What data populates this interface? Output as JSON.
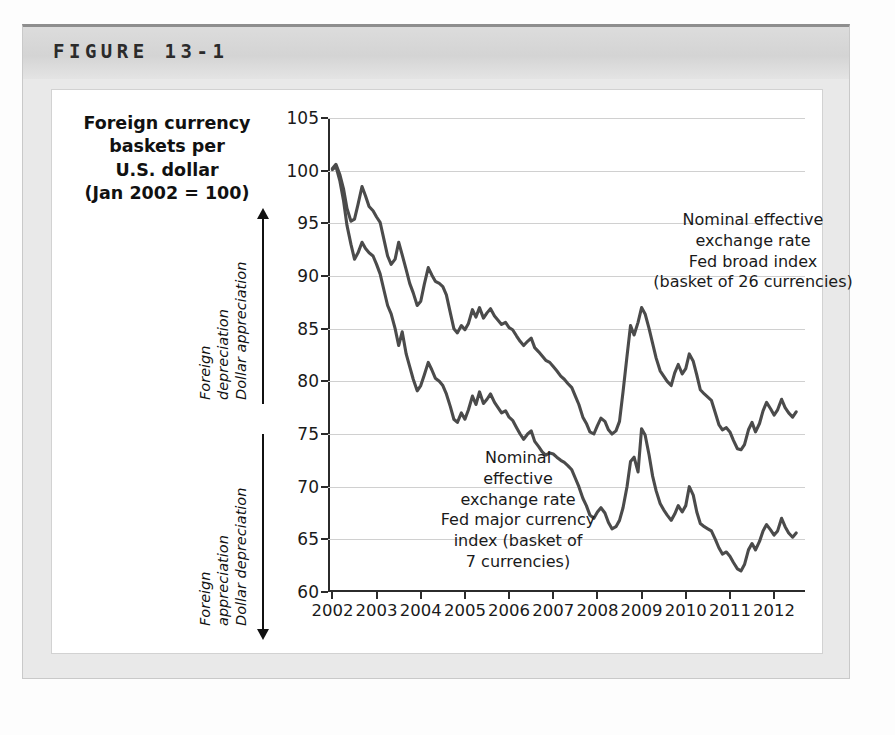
{
  "figure": {
    "label": "FIGURE 13-1"
  },
  "axis_title": {
    "line1": "Foreign currency",
    "line2": "baskets per",
    "line3": "U.S. dollar",
    "line4": "(Jan 2002 = 100)"
  },
  "direction_annotations": {
    "upper": {
      "line1": "Foreign",
      "line2": "depreciation",
      "line3": "Dollar appreciation",
      "arrow": "arrow-up"
    },
    "lower": {
      "line1": "Foreign",
      "line2": "appreciation",
      "line3": "Dollar depreciation",
      "arrow": "arrow-down"
    }
  },
  "series_annotations": {
    "broad": {
      "line1": "Nominal effective",
      "line2": "exchange rate",
      "line3": "Fed broad index",
      "line4": "(basket of 26 currencies)"
    },
    "major": {
      "line1": "Nominal",
      "line2": "effective",
      "line3": "exchange rate",
      "line4": "Fed major currency",
      "line5": "index (basket of",
      "line6": "7 currencies)"
    }
  },
  "colors": {
    "line": "#4b4b4b",
    "grid": "#d0d0d0",
    "axis": "#2b2b2b",
    "card_background": "#e9e9e9",
    "header_band": "#d7d7d7",
    "panel": "#ffffff"
  },
  "chart_data": {
    "type": "line",
    "title": "Foreign currency baskets per U.S. dollar (Jan 2002 = 100)",
    "xlabel": "",
    "ylabel": "Foreign currency baskets per U.S. dollar (Jan 2002 = 100)",
    "xlim": [
      2001.9,
      2012.7
    ],
    "ylim": [
      60,
      105
    ],
    "ytick_labels": [
      "60",
      "65",
      "70",
      "75",
      "80",
      "85",
      "90",
      "95",
      "100",
      "105"
    ],
    "yticks": [
      60,
      65,
      70,
      75,
      80,
      85,
      90,
      95,
      100,
      105
    ],
    "xtick_labels": [
      "2002",
      "2003",
      "2004",
      "2005",
      "2006",
      "2007",
      "2008",
      "2009",
      "2010",
      "2011",
      "2012"
    ],
    "xticks": [
      2002,
      2003,
      2004,
      2005,
      2006,
      2007,
      2008,
      2009,
      2010,
      2011,
      2012
    ],
    "grid": true,
    "legend": "in-plot annotations",
    "series": [
      {
        "name": "Nominal effective exchange rate Fed broad index (basket of 26 currencies)",
        "x": [
          2002.0,
          2002.08,
          2002.17,
          2002.25,
          2002.33,
          2002.42,
          2002.5,
          2002.58,
          2002.67,
          2002.75,
          2002.83,
          2002.92,
          2003.0,
          2003.08,
          2003.17,
          2003.25,
          2003.33,
          2003.42,
          2003.5,
          2003.58,
          2003.67,
          2003.75,
          2003.83,
          2003.92,
          2004.0,
          2004.08,
          2004.17,
          2004.25,
          2004.33,
          2004.42,
          2004.5,
          2004.58,
          2004.67,
          2004.75,
          2004.83,
          2004.92,
          2005.0,
          2005.08,
          2005.17,
          2005.25,
          2005.33,
          2005.42,
          2005.5,
          2005.58,
          2005.67,
          2005.75,
          2005.83,
          2005.92,
          2006.0,
          2006.08,
          2006.17,
          2006.25,
          2006.33,
          2006.42,
          2006.5,
          2006.58,
          2006.67,
          2006.75,
          2006.83,
          2006.92,
          2007.0,
          2007.08,
          2007.17,
          2007.25,
          2007.33,
          2007.42,
          2007.5,
          2007.58,
          2007.67,
          2007.75,
          2007.83,
          2007.92,
          2008.0,
          2008.08,
          2008.17,
          2008.25,
          2008.33,
          2008.42,
          2008.5,
          2008.58,
          2008.67,
          2008.75,
          2008.83,
          2008.92,
          2009.0,
          2009.08,
          2009.17,
          2009.25,
          2009.33,
          2009.42,
          2009.5,
          2009.58,
          2009.67,
          2009.75,
          2009.83,
          2009.92,
          2010.0,
          2010.08,
          2010.17,
          2010.25,
          2010.33,
          2010.42,
          2010.5,
          2010.58,
          2010.67,
          2010.75,
          2010.83,
          2010.92,
          2011.0,
          2011.08,
          2011.17,
          2011.25,
          2011.33,
          2011.42,
          2011.5,
          2011.58,
          2011.67,
          2011.75,
          2011.83,
          2011.92,
          2012.0,
          2012.08,
          2012.17,
          2012.25,
          2012.33,
          2012.42,
          2012.5
        ],
        "y": [
          100.2,
          100.6,
          99.6,
          98.3,
          96.4,
          95.2,
          95.4,
          96.8,
          98.5,
          97.6,
          96.6,
          96.2,
          95.6,
          95.1,
          93.4,
          91.9,
          91.1,
          91.6,
          93.2,
          92.0,
          90.6,
          89.3,
          88.4,
          87.2,
          87.6,
          89.2,
          90.8,
          90.1,
          89.5,
          89.3,
          89.0,
          88.2,
          86.5,
          85.0,
          84.6,
          85.3,
          84.9,
          85.5,
          86.8,
          86.1,
          87.0,
          86.0,
          86.5,
          86.9,
          86.2,
          85.8,
          85.4,
          85.6,
          85.1,
          84.9,
          84.3,
          83.8,
          83.4,
          83.8,
          84.1,
          83.2,
          82.8,
          82.4,
          82.0,
          81.8,
          81.4,
          81.0,
          80.5,
          80.2,
          79.8,
          79.4,
          78.6,
          77.8,
          76.6,
          76.0,
          75.2,
          75.0,
          75.8,
          76.5,
          76.2,
          75.4,
          75.0,
          75.3,
          76.2,
          79.0,
          82.4,
          85.3,
          84.4,
          85.6,
          87.0,
          86.4,
          85.0,
          83.6,
          82.2,
          81.0,
          80.5,
          80.0,
          79.6,
          80.8,
          81.6,
          80.7,
          81.2,
          82.6,
          81.9,
          80.6,
          79.2,
          78.8,
          78.5,
          78.2,
          77.0,
          75.9,
          75.4,
          75.6,
          75.2,
          74.4,
          73.6,
          73.5,
          74.0,
          75.4,
          76.1,
          75.2,
          76.0,
          77.2,
          78.0,
          77.4,
          76.8,
          77.3,
          78.3,
          77.5,
          77.0,
          76.6,
          77.1
        ]
      },
      {
        "name": "Nominal effective exchange rate Fed major currency index (basket of 7 currencies)",
        "x": [
          2002.0,
          2002.08,
          2002.17,
          2002.25,
          2002.33,
          2002.42,
          2002.5,
          2002.58,
          2002.67,
          2002.75,
          2002.83,
          2002.92,
          2003.0,
          2003.08,
          2003.17,
          2003.25,
          2003.33,
          2003.42,
          2003.5,
          2003.58,
          2003.67,
          2003.75,
          2003.83,
          2003.92,
          2004.0,
          2004.08,
          2004.17,
          2004.25,
          2004.33,
          2004.42,
          2004.5,
          2004.58,
          2004.67,
          2004.75,
          2004.83,
          2004.92,
          2005.0,
          2005.08,
          2005.17,
          2005.25,
          2005.33,
          2005.42,
          2005.5,
          2005.58,
          2005.67,
          2005.75,
          2005.83,
          2005.92,
          2006.0,
          2006.08,
          2006.17,
          2006.25,
          2006.33,
          2006.42,
          2006.5,
          2006.58,
          2006.67,
          2006.75,
          2006.83,
          2006.92,
          2007.0,
          2007.08,
          2007.17,
          2007.25,
          2007.33,
          2007.42,
          2007.5,
          2007.58,
          2007.67,
          2007.75,
          2007.83,
          2007.92,
          2008.0,
          2008.08,
          2008.17,
          2008.25,
          2008.33,
          2008.42,
          2008.5,
          2008.58,
          2008.67,
          2008.75,
          2008.83,
          2008.92,
          2009.0,
          2009.08,
          2009.17,
          2009.25,
          2009.33,
          2009.42,
          2009.5,
          2009.58,
          2009.67,
          2009.75,
          2009.83,
          2009.92,
          2010.0,
          2010.08,
          2010.17,
          2010.25,
          2010.33,
          2010.42,
          2010.5,
          2010.58,
          2010.67,
          2010.75,
          2010.83,
          2010.92,
          2011.0,
          2011.08,
          2011.17,
          2011.25,
          2011.33,
          2011.42,
          2011.5,
          2011.58,
          2011.67,
          2011.75,
          2011.83,
          2011.92,
          2012.0,
          2012.08,
          2012.17,
          2012.25,
          2012.33,
          2012.42,
          2012.5
        ],
        "y": [
          100.1,
          100.4,
          99.0,
          97.2,
          94.8,
          93.0,
          91.6,
          92.2,
          93.2,
          92.6,
          92.2,
          91.9,
          91.1,
          90.2,
          88.6,
          87.2,
          86.4,
          85.0,
          83.4,
          84.7,
          82.6,
          81.4,
          80.2,
          79.1,
          79.6,
          80.6,
          81.8,
          81.1,
          80.3,
          80.0,
          79.6,
          78.8,
          77.6,
          76.4,
          76.1,
          77.0,
          76.4,
          77.3,
          78.6,
          77.8,
          79.0,
          77.9,
          78.3,
          78.8,
          78.0,
          77.5,
          77.0,
          77.2,
          76.6,
          76.3,
          75.6,
          75.0,
          74.5,
          75.0,
          75.3,
          74.3,
          73.8,
          73.3,
          73.0,
          73.2,
          73.1,
          72.8,
          72.5,
          72.3,
          72.0,
          71.6,
          70.8,
          70.0,
          68.9,
          68.2,
          67.3,
          67.0,
          67.6,
          68.0,
          67.5,
          66.6,
          66.0,
          66.2,
          66.8,
          68.0,
          70.0,
          72.4,
          72.8,
          71.4,
          75.5,
          74.9,
          73.0,
          71.0,
          69.6,
          68.4,
          67.8,
          67.3,
          66.8,
          67.4,
          68.2,
          67.6,
          68.2,
          70.0,
          69.2,
          67.6,
          66.5,
          66.2,
          66.0,
          65.8,
          65.0,
          64.2,
          63.6,
          63.8,
          63.4,
          62.8,
          62.2,
          62.0,
          62.6,
          64.0,
          64.6,
          64.0,
          64.8,
          65.8,
          66.4,
          65.9,
          65.4,
          65.8,
          67.0,
          66.2,
          65.6,
          65.2,
          65.6
        ]
      }
    ]
  }
}
